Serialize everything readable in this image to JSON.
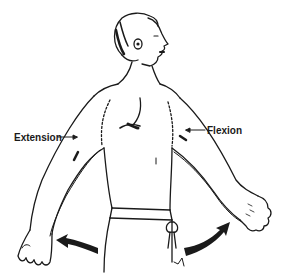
{
  "diagram": {
    "labels": {
      "extension": "Extension",
      "flexion": "Flexion"
    },
    "colors": {
      "line": "#1a1a1a",
      "background": "#ffffff"
    }
  }
}
